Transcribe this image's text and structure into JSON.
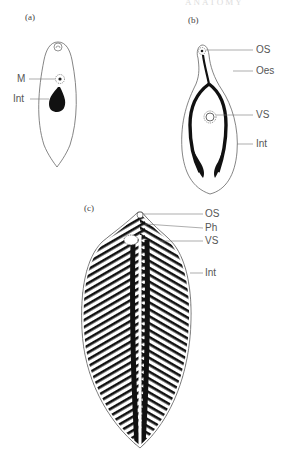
{
  "header": {
    "cut_off_text": "ANATOMY"
  },
  "figures": [
    {
      "id": "a",
      "panel_label": "(a)",
      "labels": [
        {
          "key": "M",
          "text": "M"
        },
        {
          "key": "Int",
          "text": "Int"
        }
      ]
    },
    {
      "id": "b",
      "panel_label": "(b)",
      "labels": [
        {
          "key": "OS",
          "text": "OS"
        },
        {
          "key": "Oes",
          "text": "Oes"
        },
        {
          "key": "VS",
          "text": "VS"
        },
        {
          "key": "Int",
          "text": "Int"
        }
      ]
    },
    {
      "id": "c",
      "panel_label": "(c)",
      "labels": [
        {
          "key": "OS",
          "text": "OS"
        },
        {
          "key": "Ph",
          "text": "Ph"
        },
        {
          "key": "VS",
          "text": "VS"
        },
        {
          "key": "Int",
          "text": "Int"
        }
      ]
    }
  ],
  "colors": {
    "outline": "#555555",
    "fill": "#111111",
    "leader": "#777777",
    "text": "#555555"
  }
}
